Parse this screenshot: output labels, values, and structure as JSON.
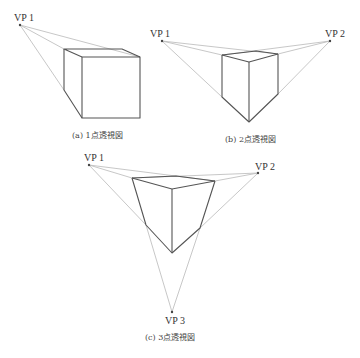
{
  "figure": {
    "panels": [
      {
        "id": "a",
        "caption": "(a)  1点透視図",
        "vanishing_points": [
          {
            "label": "VP 1",
            "x": 20,
            "y": 25
          }
        ]
      },
      {
        "id": "b",
        "caption": "(b)  2点透視図",
        "vanishing_points": [
          {
            "label": "VP 1",
            "x": 162,
            "y": 41
          },
          {
            "label": "VP 2",
            "x": 330,
            "y": 41
          }
        ]
      },
      {
        "id": "c",
        "caption": "(c)  3点透視図",
        "vanishing_points": [
          {
            "label": "VP 1",
            "x": 89,
            "y": 165
          },
          {
            "label": "VP 2",
            "x": 258,
            "y": 173
          },
          {
            "label": "VP 3",
            "x": 172,
            "y": 312
          }
        ]
      }
    ]
  },
  "colors": {
    "guide_line": "#b9b9b9",
    "edge_line": "#555555",
    "text": "#333333"
  }
}
